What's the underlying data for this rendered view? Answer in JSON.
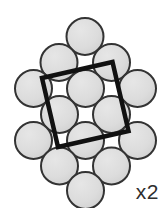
{
  "figure": {
    "kind": "crystal-packing-diagram",
    "caption_label": "x2",
    "background_color": "#ffffff",
    "atom": {
      "fill_color": "#d9d9d9",
      "highlight_color": "#e8e8e8",
      "stroke_color": "#333333",
      "stroke_width": 2,
      "radius": 18.5
    },
    "unit_cell": {
      "shape": "square",
      "stroke_color": "#111111",
      "stroke_width": 4.5,
      "rotation_degrees": -13,
      "corners": [
        {
          "x": 42.0,
          "y": 78.0
        },
        {
          "x": 112.5,
          "y": 62.0
        },
        {
          "x": 128.5,
          "y": 131.0
        },
        {
          "x": 58.0,
          "y": 147.0
        }
      ]
    },
    "lattice": {
      "description": "rotated square close-packed cluster",
      "rows": [
        {
          "row": 1,
          "count": 1,
          "y": 36.5,
          "x_positions": [
            85.0
          ]
        },
        {
          "row": 2,
          "count": 2,
          "y": 70.0,
          "x_positions": [
            59.0,
            111.0
          ]
        },
        {
          "row": 3,
          "count": 3,
          "y": 78.5,
          "x_positions": [
            34.0,
            85.5,
            137.0
          ]
        },
        {
          "row": 4,
          "count": 2,
          "y": 104.0,
          "x_positions": [
            60.0,
            111.5
          ]
        },
        {
          "row": 5,
          "count": 3,
          "y": 130.0,
          "x_positions": [
            34.5,
            86.0,
            137.5
          ]
        },
        {
          "row": 6,
          "count": 2,
          "y": 139.0,
          "x_positions": [
            60.0,
            111.5
          ]
        },
        {
          "row": 7,
          "count": 1,
          "y": 172.5,
          "x_positions": [
            85.5
          ]
        }
      ],
      "atom_count": 17
    },
    "atoms": [
      {
        "id": "a1",
        "x": 85.0,
        "y": 36.5
      },
      {
        "id": "a2",
        "x": 59.0,
        "y": 62.5
      },
      {
        "id": "a3",
        "x": 111.5,
        "y": 62.5
      },
      {
        "id": "a4",
        "x": 33.5,
        "y": 88.5
      },
      {
        "id": "a5",
        "x": 85.5,
        "y": 88.5
      },
      {
        "id": "a6",
        "x": 137.5,
        "y": 88.5
      },
      {
        "id": "a7",
        "x": 59.5,
        "y": 114.5
      },
      {
        "id": "a8",
        "x": 111.5,
        "y": 114.5
      },
      {
        "id": "a9",
        "x": 33.5,
        "y": 140.5
      },
      {
        "id": "a10",
        "x": 85.5,
        "y": 140.5
      },
      {
        "id": "a11",
        "x": 137.5,
        "y": 140.5
      },
      {
        "id": "a12",
        "x": 59.5,
        "y": 166.0
      },
      {
        "id": "a13",
        "x": 111.5,
        "y": 166.0
      },
      {
        "id": "a14",
        "x": 85.5,
        "y": 190.5
      }
    ]
  }
}
